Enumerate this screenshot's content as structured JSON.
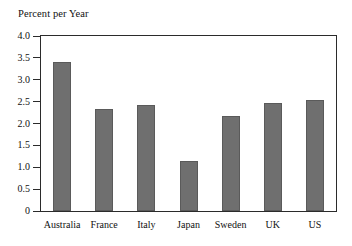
{
  "chart_data": {
    "type": "bar",
    "title": "Percent per Year",
    "xlabel": "",
    "ylabel": "",
    "categories": [
      "Australia",
      "France",
      "Italy",
      "Japan",
      "Sweden",
      "UK",
      "US"
    ],
    "values": [
      3.4,
      2.32,
      2.43,
      1.15,
      2.16,
      2.47,
      2.54
    ],
    "ylim": [
      0,
      4.0
    ],
    "ytick_labels": [
      "4.0",
      "3.5",
      "3.0",
      "2.5",
      "2.0",
      "1.5",
      "1.0",
      "0.5",
      "0"
    ],
    "ytick_values": [
      4.0,
      3.5,
      3.0,
      2.5,
      2.0,
      1.5,
      1.0,
      0.5,
      0
    ],
    "grid": false,
    "legend": null,
    "bar_color": "#6f6f6f",
    "frame_color": "#2b2b2b",
    "background": "#ffffff"
  }
}
